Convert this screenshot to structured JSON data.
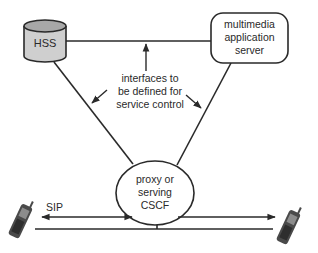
{
  "diagram": {
    "nodes": {
      "hss": {
        "label": "HSS",
        "shape": "cylinder",
        "fill": "#cfcfcf"
      },
      "app_server": {
        "label_lines": [
          "multimedia",
          "application",
          "server"
        ],
        "shape": "rounded-rectangle"
      },
      "cscf": {
        "label_lines": [
          "proxy or",
          "serving",
          "CSCF"
        ],
        "shape": "ellipse"
      },
      "phone_left": {
        "icon": "mobile-phone-icon"
      },
      "phone_right": {
        "icon": "mobile-phone-icon"
      }
    },
    "annotations": {
      "interfaces": {
        "lines": [
          "interfaces to",
          "be defined for",
          "service control"
        ]
      },
      "sip": {
        "label": "SIP"
      }
    },
    "colors": {
      "line": "#2a2a2a",
      "cylinder_fill": "#cfcfcf",
      "cylinder_top": "#a8a8a8",
      "background": "#ffffff"
    }
  }
}
